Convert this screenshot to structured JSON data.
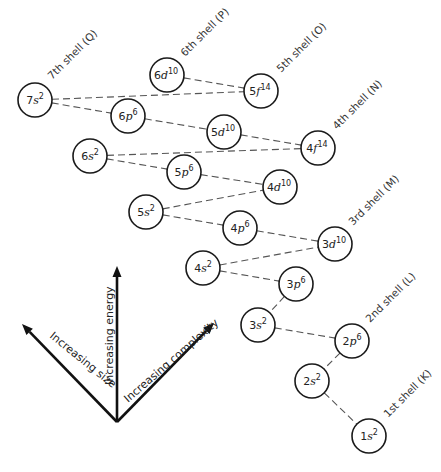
{
  "diagram": {
    "colors": {
      "stroke": "#1a1a1a",
      "dash": "#555555",
      "text": "#222222",
      "background": "#ffffff"
    },
    "orbitals": [
      {
        "id": "7s",
        "n": "7",
        "l": "s",
        "e": "2",
        "x": 35,
        "y": 100
      },
      {
        "id": "6d",
        "n": "6",
        "l": "d",
        "e": "10",
        "x": 167,
        "y": 75
      },
      {
        "id": "6p",
        "n": "6",
        "l": "p",
        "e": "6",
        "x": 128,
        "y": 116
      },
      {
        "id": "5f",
        "n": "5",
        "l": "f",
        "e": "14",
        "x": 261,
        "y": 91
      },
      {
        "id": "6s",
        "n": "6",
        "l": "s",
        "e": "2",
        "x": 90,
        "y": 156
      },
      {
        "id": "5d",
        "n": "5",
        "l": "d",
        "e": "10",
        "x": 224,
        "y": 132
      },
      {
        "id": "5p",
        "n": "5",
        "l": "p",
        "e": "6",
        "x": 184,
        "y": 172
      },
      {
        "id": "4f",
        "n": "4",
        "l": "f",
        "e": "14",
        "x": 318,
        "y": 148
      },
      {
        "id": "5s",
        "n": "5",
        "l": "s",
        "e": "2",
        "x": 146,
        "y": 212
      },
      {
        "id": "4d",
        "n": "4",
        "l": "d",
        "e": "10",
        "x": 280,
        "y": 187
      },
      {
        "id": "4p",
        "n": "4",
        "l": "p",
        "e": "6",
        "x": 240,
        "y": 228
      },
      {
        "id": "3d",
        "n": "3",
        "l": "d",
        "e": "10",
        "x": 335,
        "y": 244
      },
      {
        "id": "4s",
        "n": "4",
        "l": "s",
        "e": "2",
        "x": 203,
        "y": 268
      },
      {
        "id": "3p",
        "n": "3",
        "l": "p",
        "e": "6",
        "x": 296,
        "y": 284
      },
      {
        "id": "3s",
        "n": "3",
        "l": "s",
        "e": "2",
        "x": 258,
        "y": 325
      },
      {
        "id": "2p",
        "n": "2",
        "l": "p",
        "e": "6",
        "x": 352,
        "y": 341
      },
      {
        "id": "2s",
        "n": "2",
        "l": "s",
        "e": "2",
        "x": 312,
        "y": 381
      },
      {
        "id": "1s",
        "n": "1",
        "l": "s",
        "e": "2",
        "x": 369,
        "y": 436
      }
    ],
    "connections": [
      [
        "7s",
        "5f"
      ],
      [
        "7s",
        "6p"
      ],
      [
        "6d",
        "5f"
      ],
      [
        "6p",
        "5d"
      ],
      [
        "6s",
        "4f"
      ],
      [
        "6s",
        "5p"
      ],
      [
        "5d",
        "4f"
      ],
      [
        "5p",
        "4d"
      ],
      [
        "5s",
        "4d"
      ],
      [
        "5s",
        "4p"
      ],
      [
        "4p",
        "3d"
      ],
      [
        "4s",
        "3d"
      ],
      [
        "4s",
        "3p"
      ],
      [
        "3p",
        "3s"
      ],
      [
        "3s",
        "2p"
      ],
      [
        "2p",
        "2s"
      ],
      [
        "2s",
        "1s"
      ]
    ],
    "shell_labels": [
      {
        "text": "7th shell (Q)",
        "x": 52,
        "y": 80
      },
      {
        "text": "6th shell (P)",
        "x": 185,
        "y": 57
      },
      {
        "text": "5th shell (O)",
        "x": 281,
        "y": 73
      },
      {
        "text": "4th shell (N)",
        "x": 337,
        "y": 130
      },
      {
        "text": "3rd shell (M)",
        "x": 353,
        "y": 226
      },
      {
        "text": "2nd shell (L)",
        "x": 370,
        "y": 323
      },
      {
        "text": "1st shell (K)",
        "x": 388,
        "y": 418
      }
    ],
    "arrows": {
      "origin": {
        "x": 117,
        "y": 422
      },
      "energy": {
        "label": "Increasing energy",
        "tip": {
          "x": 117,
          "y": 266
        }
      },
      "size": {
        "label": "Increasing size",
        "tip": {
          "x": 22,
          "y": 324
        }
      },
      "complexity": {
        "label": "Increasing complexity",
        "tip": {
          "x": 214,
          "y": 323
        }
      }
    }
  }
}
